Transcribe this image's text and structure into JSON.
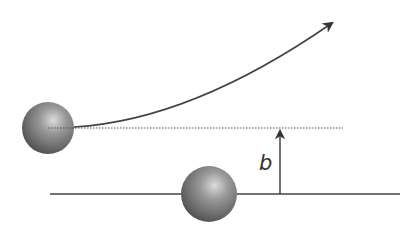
{
  "diagram": {
    "labels": {
      "impact_parameter": "b"
    },
    "colors": {
      "background": "#ffffff",
      "line": "#444444",
      "dotted": "#555555",
      "sphere_light": "#d9d9d9",
      "sphere_mid": "#8a8a8a",
      "sphere_dark": "#4a4a4a"
    },
    "elements": {
      "incoming_sphere": {
        "cx": 48,
        "cy": 128,
        "r": 26
      },
      "target_sphere": {
        "cx": 209,
        "cy": 194,
        "r": 28
      },
      "baseline": {
        "x1": 50,
        "y1": 194,
        "x2": 400,
        "y2": 194
      },
      "incoming_dotted_line": {
        "x1": 48,
        "y1": 128,
        "x2": 343,
        "y2": 128
      },
      "deflected_trajectory": {
        "start": [
          74,
          127
        ],
        "end": [
          332,
          23
        ]
      },
      "impact_parameter_arrow": {
        "x": 280,
        "y_from": 194,
        "y_to": 128
      },
      "b_label_position": [
        262,
        170
      ]
    }
  }
}
